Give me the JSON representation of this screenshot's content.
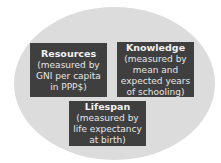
{
  "diagram": {
    "background_color": "#dcdcdc",
    "box_color": "#3f3f3f",
    "text_color": "#f2f2f2",
    "boxes": [
      {
        "title": "Resources",
        "lines": [
          "(measured by",
          "GNI per capita",
          "in PPP$)"
        ]
      },
      {
        "title": "Knowledge",
        "lines": [
          "(measured by",
          "mean and",
          "expected years",
          "of schooling)"
        ]
      },
      {
        "title": "Lifespan",
        "lines": [
          "(measured by",
          "life expectancy",
          "at birth)"
        ]
      }
    ]
  }
}
